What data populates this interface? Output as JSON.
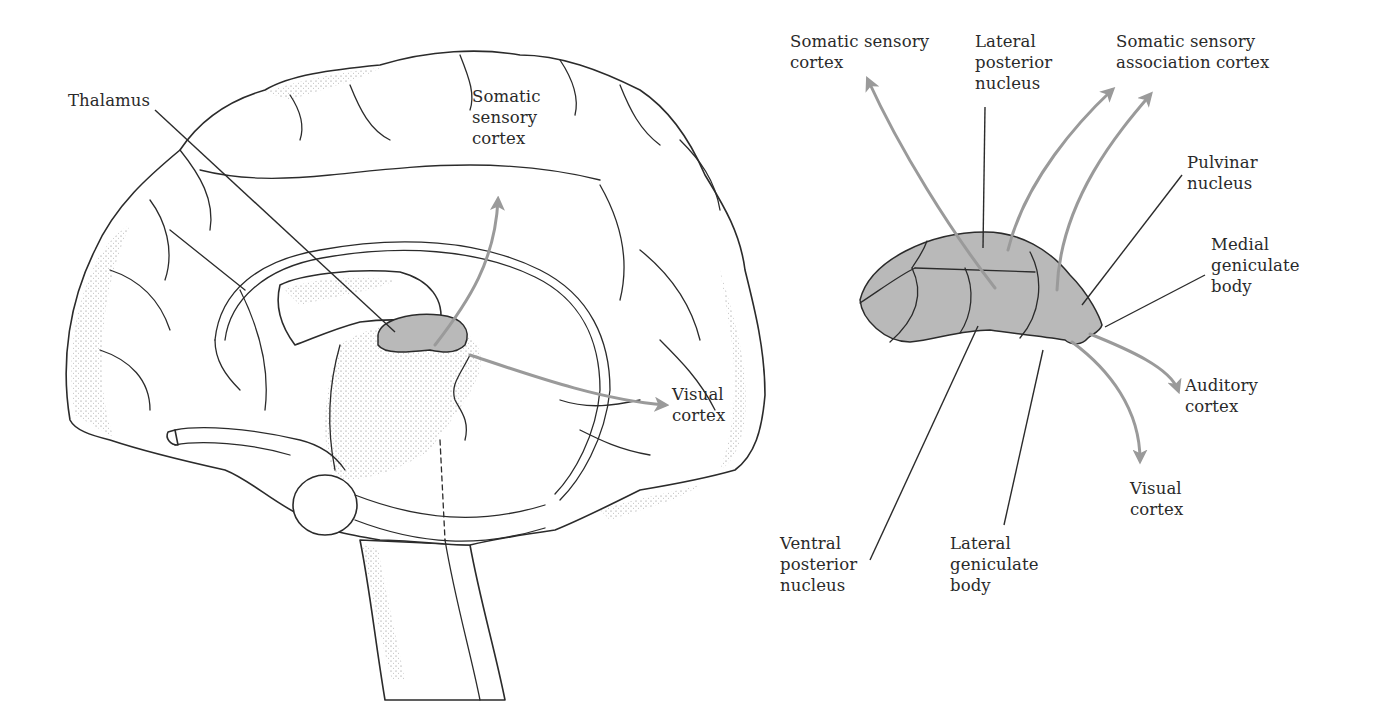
{
  "figure": {
    "left_panel": {
      "title": "Medial view of brain with thalamus",
      "labels": {
        "thalamus": "Thalamus",
        "somatic_sensory_cortex": "Somatic\nsensory\ncortex",
        "visual_cortex": "Visual\ncortex"
      }
    },
    "right_panel": {
      "title": "Thalamic nuclei and cortical projections",
      "labels": {
        "somatic_sensory_cortex": "Somatic sensory\ncortex",
        "lateral_posterior_nucleus": "Lateral\nposterior\nnucleus",
        "somatic_sensory_association_cortex": "Somatic sensory\nassociation cortex",
        "pulvinar_nucleus": "Pulvinar\nnucleus",
        "medial_geniculate_body": "Medial\ngeniculate\nbody",
        "auditory_cortex": "Auditory\ncortex",
        "visual_cortex": "Visual\ncortex",
        "ventral_posterior_nucleus": "Ventral\nposterior\nnucleus",
        "lateral_geniculate_body": "Lateral\ngeniculate\nbody"
      }
    },
    "colors": {
      "outline": "#2b2b2b",
      "thalamus_fill": "#b9b9b9",
      "projection_arrow": "#9a9a9a",
      "text": "#2a2a2a",
      "background": "#ffffff"
    }
  }
}
